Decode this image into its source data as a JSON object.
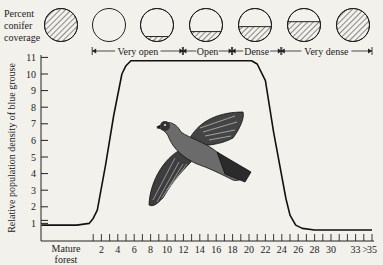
{
  "chart_data": {
    "type": "line",
    "title": "",
    "xlabel": "",
    "ylabel": "Relative population density of blue grouse",
    "ylim": [
      0,
      11
    ],
    "y_ticks": [
      "1",
      "2",
      "3",
      "4",
      "5",
      "6",
      "7",
      "8",
      "9",
      "10",
      "11"
    ],
    "x_first_label": "Mature forest",
    "x_tick_labels": [
      "2",
      "4",
      "6",
      "8",
      "10",
      "12",
      "14",
      "16",
      "18",
      "20",
      "22",
      "24",
      "26",
      "28",
      "30",
      "33",
      ">",
      "35"
    ],
    "x_tick_label_values": [
      2,
      4,
      6,
      8,
      10,
      12,
      14,
      16,
      18,
      20,
      22,
      24,
      26,
      28,
      30,
      33,
      34.2,
      35
    ],
    "x_minor_ticks": [
      1,
      2,
      3,
      4,
      5,
      6,
      7,
      8,
      9,
      10,
      11,
      12,
      13,
      14,
      15,
      16,
      17,
      18,
      19,
      20,
      21,
      22,
      23,
      24,
      25,
      26,
      27,
      28,
      29,
      30,
      31,
      32,
      33,
      34,
      35
    ],
    "grid": false,
    "series": [
      {
        "name": "Blue grouse density",
        "x": [
          -5.3,
          -1.0,
          0.5,
          1.0,
          1.5,
          2.5,
          3.5,
          4.5,
          5.0,
          5.6,
          6.5,
          10,
          15,
          19,
          20.3,
          21.0,
          22,
          23,
          24.5,
          25.0,
          25.7,
          26.5,
          28,
          32,
          35
        ],
        "values": [
          0.9,
          0.9,
          1.0,
          1.3,
          1.8,
          4.5,
          7.5,
          10.0,
          10.5,
          10.8,
          10.8,
          10.8,
          10.8,
          10.8,
          10.8,
          10.6,
          9.6,
          6.5,
          2.5,
          1.5,
          0.9,
          0.7,
          0.6,
          0.6,
          0.6
        ]
      }
    ],
    "annotations": {
      "coverage_label": [
        "Percent",
        "conifer",
        "coverage"
      ],
      "coverage_circles": [
        {
          "stage": "Mature forest",
          "fill_fraction": 1.0
        },
        {
          "stage": "Very open",
          "fill_fraction": 0.0
        },
        {
          "stage": "Very open",
          "fill_fraction": 0.15
        },
        {
          "stage": "Open",
          "fill_fraction": 0.3
        },
        {
          "stage": "Dense",
          "fill_fraction": 0.45
        },
        {
          "stage": "Very dense",
          "fill_fraction": 0.6
        },
        {
          "stage": "Very dense",
          "fill_fraction": 1.0
        }
      ],
      "stage_brackets": [
        {
          "label": "Very open",
          "from": 1,
          "to": 12
        },
        {
          "label": "Open",
          "from": 12,
          "to": 18
        },
        {
          "label": "Dense",
          "from": 18,
          "to": 24
        },
        {
          "label": "Very dense",
          "from": 24,
          "to": 35
        }
      ],
      "illustration": "blue grouse in flight"
    }
  }
}
